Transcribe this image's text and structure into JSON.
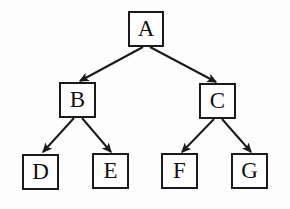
{
  "diagram": {
    "type": "binary-tree",
    "background_color": "#fdfdfd",
    "stroke_color": "#1a1a1a",
    "text_color": "#111111",
    "canvas": {
      "width": 290,
      "height": 209
    },
    "nodes": [
      {
        "id": "A",
        "label": "A",
        "x": 128,
        "y": 11,
        "w": 36,
        "h": 36,
        "level": 0
      },
      {
        "id": "B",
        "label": "B",
        "x": 59,
        "y": 82,
        "w": 37,
        "h": 36,
        "level": 1
      },
      {
        "id": "C",
        "label": "C",
        "x": 199,
        "y": 83,
        "w": 37,
        "h": 36,
        "level": 1
      },
      {
        "id": "D",
        "label": "D",
        "x": 22,
        "y": 154,
        "w": 37,
        "h": 36,
        "level": 2
      },
      {
        "id": "E",
        "label": "E",
        "x": 92,
        "y": 153,
        "w": 37,
        "h": 36,
        "level": 2
      },
      {
        "id": "F",
        "label": "F",
        "x": 161,
        "y": 153,
        "w": 37,
        "h": 36,
        "level": 2
      },
      {
        "id": "G",
        "label": "G",
        "x": 231,
        "y": 153,
        "w": 37,
        "h": 36,
        "level": 2
      }
    ],
    "edges": [
      {
        "id": "A-B",
        "from": "A",
        "to": "B",
        "x1": 143,
        "y1": 47,
        "x2": 80,
        "y2": 81,
        "arrow": "filled-triangle"
      },
      {
        "id": "A-C",
        "from": "A",
        "to": "C",
        "x1": 150,
        "y1": 47,
        "x2": 216,
        "y2": 82,
        "arrow": "filled-triangle"
      },
      {
        "id": "B-D",
        "from": "B",
        "to": "D",
        "x1": 74,
        "y1": 118,
        "x2": 43,
        "y2": 152,
        "arrow": "filled-triangle"
      },
      {
        "id": "B-E",
        "from": "B",
        "to": "E",
        "x1": 82,
        "y1": 118,
        "x2": 111,
        "y2": 152,
        "arrow": "filled-triangle"
      },
      {
        "id": "C-F",
        "from": "C",
        "to": "F",
        "x1": 214,
        "y1": 119,
        "x2": 182,
        "y2": 152,
        "arrow": "filled-triangle"
      },
      {
        "id": "C-G",
        "from": "C",
        "to": "G",
        "x1": 222,
        "y1": 119,
        "x2": 251,
        "y2": 152,
        "arrow": "filled-triangle"
      }
    ]
  }
}
